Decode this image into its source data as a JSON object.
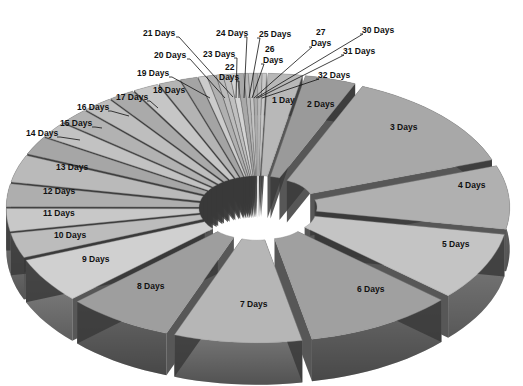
{
  "chart_data": {
    "type": "pie",
    "style": "3d-exploded",
    "title": "",
    "categories": [
      "1 Day",
      "2 Days",
      "3 Days",
      "4 Days",
      "5 Days",
      "6 Days",
      "7 Days",
      "8 Days",
      "9 Days",
      "10 Days",
      "11 Days",
      "12 Days",
      "13 Days",
      "14 Days",
      "15 Days",
      "16 Days",
      "17 Days",
      "18 Days",
      "19 Days",
      "20 Days",
      "21 Days",
      "22 Days",
      "23 Days",
      "24 Days",
      "25 Days",
      "26 Days",
      "27 Days",
      "28 Days",
      "29 Days",
      "30 Days",
      "31 Days",
      "32 Days"
    ],
    "values": [
      8,
      12,
      45,
      28,
      30,
      35,
      30,
      25,
      20,
      11,
      10,
      10,
      12,
      8,
      7,
      7,
      7,
      6,
      6,
      5,
      4,
      2,
      2,
      1.5,
      1.5,
      1.5,
      1.5,
      1,
      1,
      1,
      1,
      1
    ],
    "value_units": "degrees (estimated slice angle; no numeric labels shown)",
    "legend": "none (labels attached to slices)",
    "colors": [
      "#b8b8b8",
      "#9a9a9a",
      "#a8a8a8",
      "#b0b0b0",
      "#c4c4c4",
      "#a0a0a0",
      "#b6b6b6",
      "#9e9e9e",
      "#d0d0d0",
      "#bcbcbc",
      "#c8c8c8",
      "#aeaeae",
      "#bababa",
      "#a6a6a6",
      "#c2c2c2",
      "#b2b2b2",
      "#bebebe",
      "#aaaaaa",
      "#c6c6c6",
      "#b4b4b4",
      "#a4a4a4",
      "#cccccc",
      "#b0b0b0",
      "#bcbcbc",
      "#c0c0c0",
      "#d4d4d4",
      "#a8a8a8",
      "#b8b8b8",
      "#c4c4c4",
      "#acacac",
      "#bcbcbc",
      "#c8c8c8"
    ]
  },
  "labels": [
    {
      "text": "1 Day",
      "x": 272,
      "y": 103,
      "line": null
    },
    {
      "text": "2 Days",
      "x": 307,
      "y": 107,
      "line": null
    },
    {
      "text": "3 Days",
      "x": 390,
      "y": 130,
      "line": null
    },
    {
      "text": "4 Days",
      "x": 458,
      "y": 188,
      "line": null
    },
    {
      "text": "5 Days",
      "x": 442,
      "y": 247,
      "line": null
    },
    {
      "text": "6 Days",
      "x": 357,
      "y": 292,
      "line": null
    },
    {
      "text": "7 Days",
      "x": 240,
      "y": 307,
      "line": null
    },
    {
      "text": "8 Days",
      "x": 137,
      "y": 289,
      "line": null
    },
    {
      "text": "9 Days",
      "x": 82,
      "y": 262,
      "line": null
    },
    {
      "text": "10 Days",
      "x": 54,
      "y": 238,
      "line": null
    },
    {
      "text": "11 Days",
      "x": 43,
      "y": 216,
      "line": null
    },
    {
      "text": "12 Days",
      "x": 43,
      "y": 194,
      "line": null
    },
    {
      "text": "13 Days",
      "x": 56,
      "y": 170,
      "line": null
    },
    {
      "text": "14 Days",
      "x": 26,
      "y": 136,
      "line": [
        57,
        136,
        80,
        140
      ]
    },
    {
      "text": "15 Days",
      "x": 60,
      "y": 126,
      "line": [
        92,
        126,
        102,
        128
      ]
    },
    {
      "text": "16 Days",
      "x": 77,
      "y": 110,
      "line": [
        108,
        110,
        129,
        116
      ]
    },
    {
      "text": "17 Days",
      "x": 116,
      "y": 100,
      "line": [
        147,
        100,
        158,
        108
      ]
    },
    {
      "text": "18 Days",
      "x": 153,
      "y": 93,
      "line": null
    },
    {
      "text": "19 Days",
      "x": 137,
      "y": 76,
      "line": [
        169,
        76,
        210,
        98
      ]
    },
    {
      "text": "20 Days",
      "x": 154,
      "y": 58,
      "line": [
        187,
        58,
        225,
        98
      ]
    },
    {
      "text": "21 Days",
      "x": 143,
      "y": 36,
      "line": [
        176,
        36,
        233,
        97
      ]
    },
    {
      "text": "22",
      "x": 225,
      "y": 70,
      "line": null
    },
    {
      "text": "Days",
      "x": 219,
      "y": 80,
      "line": [
        236,
        80,
        239,
        98
      ]
    },
    {
      "text": "23 Days",
      "x": 203,
      "y": 57,
      "line": [
        234,
        57,
        236,
        98
      ]
    },
    {
      "text": "24 Days",
      "x": 216,
      "y": 36,
      "line": [
        244,
        36,
        244,
        98
      ]
    },
    {
      "text": "25 Days",
      "x": 259,
      "y": 37,
      "line": [
        257,
        37,
        249,
        98
      ]
    },
    {
      "text": "26",
      "x": 265,
      "y": 52,
      "line": null
    },
    {
      "text": "Days",
      "x": 263,
      "y": 63,
      "line": [
        261,
        63,
        252,
        98
      ]
    },
    {
      "text": "27",
      "x": 316,
      "y": 35,
      "line": null
    },
    {
      "text": "Days",
      "x": 311,
      "y": 46,
      "line": [
        309,
        46,
        254,
        98
      ]
    },
    {
      "text": "30 Days",
      "x": 362,
      "y": 33,
      "line": [
        360,
        33,
        256,
        98
      ]
    },
    {
      "text": "31 Days",
      "x": 343,
      "y": 54,
      "line": [
        341,
        54,
        258,
        98
      ]
    },
    {
      "text": "32 Days",
      "x": 318,
      "y": 78,
      "line": [
        316,
        78,
        262,
        98
      ]
    }
  ]
}
